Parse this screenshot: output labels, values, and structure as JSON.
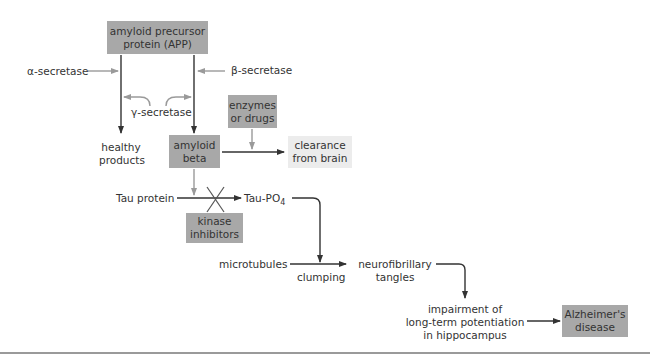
{
  "colors": {
    "box_fill": "#a8a8a8",
    "light_box_fill": "#ececec",
    "main_arrow": "#333333",
    "secondary_arrow": "#9a9a9a",
    "text": "#333333"
  },
  "nodes": {
    "app": {
      "line1": "amyloid precursor",
      "line2": "protein (APP)"
    },
    "alpha": {
      "label": "α-secretase"
    },
    "beta": {
      "label": "β-secretase"
    },
    "gamma": {
      "label": "γ-secretase"
    },
    "healthy": {
      "line1": "healthy",
      "line2": "products"
    },
    "amyloid_beta": {
      "line1": "amyloid",
      "line2": "beta"
    },
    "enzymes": {
      "line1": "enzymes",
      "line2": "or drugs"
    },
    "clearance": {
      "line1": "clearance",
      "line2": "from brain"
    },
    "tau": {
      "label": "Tau protein"
    },
    "tau_po4": {
      "label": "Tau-PO",
      "sub": "4"
    },
    "kinase": {
      "line1": "kinase",
      "line2": "inhibitors"
    },
    "microtubules": {
      "label": "microtubules"
    },
    "clumping": {
      "label": "clumping"
    },
    "tangles": {
      "line1": "neurofibrillary",
      "line2": "tangles"
    },
    "impairment": {
      "line1": "impairment of",
      "line2": "long-term potentiation",
      "line3": "in hippocampus"
    },
    "alzheimers": {
      "line1": "Alzheimer's",
      "line2": "disease"
    }
  }
}
